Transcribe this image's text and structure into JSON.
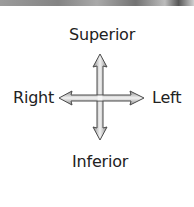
{
  "diagram": {
    "type": "anatomical-directional-compass",
    "labels": {
      "top": "Superior",
      "bottom": "Inferior",
      "left_side": "Right",
      "right_side": "Left"
    },
    "arrow": {
      "fill_light": "#f4f4f4",
      "fill_dark": "#9a9a9a",
      "stroke": "#4a4a4a"
    },
    "text_color": "#222222",
    "background": "#ffffff"
  }
}
